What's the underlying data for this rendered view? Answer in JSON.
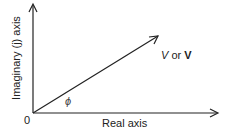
{
  "diagram": {
    "type": "phasor",
    "x_axis_label": "Real axis",
    "y_axis_label": "Imaginary (j) axis",
    "origin_label": "0",
    "angle_label": "ϕ",
    "vector_label": {
      "italic": "V",
      "middle": " or ",
      "bold": "V"
    },
    "colors": {
      "line": "#222222",
      "background": "#ffffff"
    }
  }
}
